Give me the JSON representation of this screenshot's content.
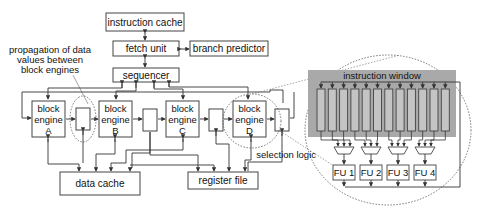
{
  "diagram": {
    "front_end": {
      "instruction_cache": "instruction cache",
      "fetch_unit": "fetch unit",
      "branch_predictor": "branch predictor",
      "sequencer": "sequencer"
    },
    "annotation": {
      "line1": "propagation of data",
      "line2": "values between",
      "line3": "block engines"
    },
    "block_engines": [
      {
        "line1": "block",
        "line2": "engine",
        "id": "A"
      },
      {
        "line1": "block",
        "line2": "engine",
        "id": "B"
      },
      {
        "line1": "block",
        "line2": "engine",
        "id": "C"
      },
      {
        "line1": "block",
        "line2": "engine",
        "id": "D"
      }
    ],
    "data_cache": "data cache",
    "register_file": "register file",
    "detail": {
      "instruction_window": "instruction window",
      "window_entries": 12,
      "selection_logic": "selection logic",
      "functional_units": [
        "FU 1",
        "FU 2",
        "FU 3",
        "FU 4"
      ]
    },
    "colors": {
      "instruction_window_bg": "#a9a9a9",
      "entry_fill": "#c4c4c4",
      "stroke": "#444444"
    }
  }
}
